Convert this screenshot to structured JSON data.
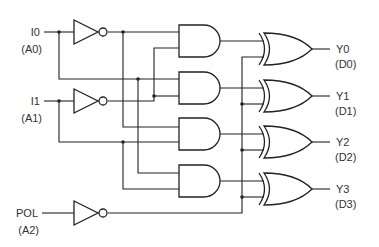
{
  "diagram": {
    "type": "logic-circuit",
    "inputs": [
      {
        "name": "I0",
        "alias": "(A0)"
      },
      {
        "name": "I1",
        "alias": "(A1)"
      },
      {
        "name": "POL",
        "alias": "(A2)"
      }
    ],
    "outputs": [
      {
        "name": "Y0",
        "alias": "(D0)"
      },
      {
        "name": "Y1",
        "alias": "(D1)"
      },
      {
        "name": "Y2",
        "alias": "(D2)"
      },
      {
        "name": "Y3",
        "alias": "(D3)"
      }
    ],
    "gates": {
      "inverters": [
        "NOT I0",
        "NOT I1",
        "NOT POL"
      ],
      "and_gates": [
        {
          "id": "AND0",
          "inputs": [
            "NOT I0",
            "NOT I1"
          ]
        },
        {
          "id": "AND1",
          "inputs": [
            "I0",
            "NOT I1"
          ]
        },
        {
          "id": "AND2",
          "inputs": [
            "NOT I0",
            "I1"
          ]
        },
        {
          "id": "AND3",
          "inputs": [
            "I0",
            "I1"
          ]
        }
      ],
      "xor_gates": [
        {
          "id": "XOR0",
          "inputs": [
            "AND0",
            "NOT POL"
          ],
          "output": "Y0"
        },
        {
          "id": "XOR1",
          "inputs": [
            "AND1",
            "NOT POL"
          ],
          "output": "Y1"
        },
        {
          "id": "XOR2",
          "inputs": [
            "AND2",
            "NOT POL"
          ],
          "output": "Y2"
        },
        {
          "id": "XOR3",
          "inputs": [
            "AND3",
            "NOT POL"
          ],
          "output": "Y3"
        }
      ]
    },
    "colors": {
      "line": "#222222",
      "text": "#333333",
      "background": "#ffffff"
    }
  }
}
